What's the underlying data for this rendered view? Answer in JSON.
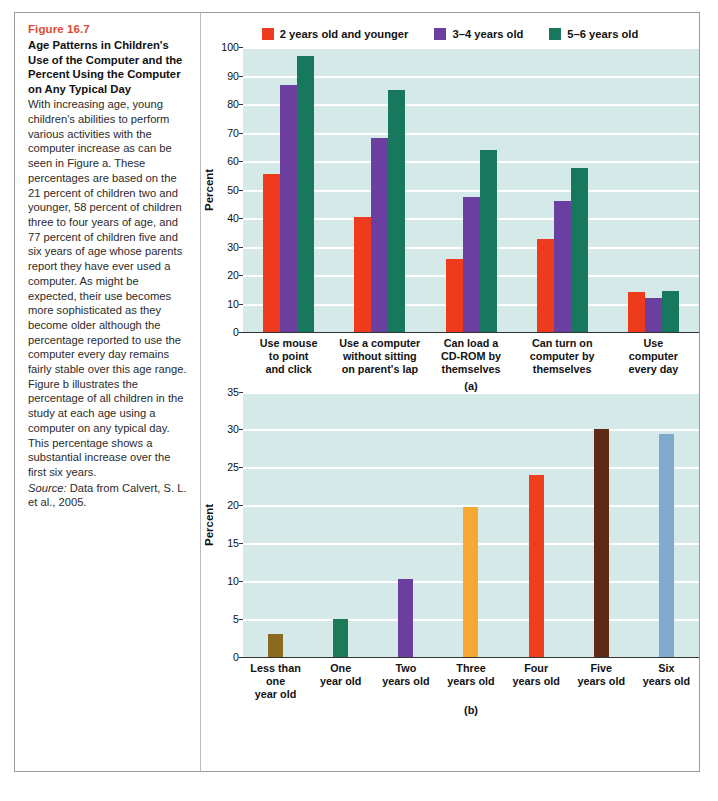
{
  "figure": {
    "number": "Figure 16.7",
    "title": "Age Patterns in Children's Use of the Computer and the Percent Using the Computer on Any Typical Day",
    "body": "With increasing age, young children's abilities to perform various activities with the computer increase as can be seen in Figure a. These percentages are based on the 21 percent of children two and younger, 58 percent of children three to four years of age, and 77 percent of children five and six years of age whose parents report they have ever used a computer. As might be expected, their use becomes more sophisticated as they become older although the percentage reported to use the computer every day remains fairly stable over this age range. Figure b illustrates the percentage of all children in the study at each age using a computer on any typical day. This percentage shows a substantial increase over the first six years.",
    "source_label": "Source:",
    "source_text": " Data from Calvert, S. L. et al., 2005."
  },
  "colors": {
    "accent": "#E04A2F",
    "plot_background": "#D6E9E9",
    "gridline": "#FFFFFF",
    "series_red": "#EE3B1E",
    "series_purple": "#6B3FA0",
    "series_green": "#17785E",
    "b_olive": "#8A6A1E",
    "b_green": "#1C7A58",
    "b_purple": "#6B3FA0",
    "b_orange": "#F7A833",
    "b_red": "#EF3E1C",
    "b_brown": "#5E2A17",
    "b_blue": "#7FAACD"
  },
  "chart_data": [
    {
      "id": "chart-a",
      "type": "bar",
      "title": "",
      "panel_caption": "(a)",
      "xlabel": "",
      "ylabel": "Percent",
      "ylim": [
        0,
        100
      ],
      "ytick_step": 10,
      "yticks": [
        0,
        10,
        20,
        30,
        40,
        50,
        60,
        70,
        80,
        90,
        100
      ],
      "grid": true,
      "legend_position": "top-center",
      "categories": [
        "Use mouse to point and click",
        "Use a computer without sitting on parent's lap",
        "Can load a CD-ROM by themselves",
        "Can turn on computer by themselves",
        "Use computer every day"
      ],
      "category_lines": [
        [
          "Use mouse",
          "to point",
          "and click"
        ],
        [
          "Use a computer",
          "without sitting",
          "on parent's lap"
        ],
        [
          "Can load a",
          "CD-ROM by",
          "themselves"
        ],
        [
          "Can turn on",
          "computer by",
          "themselves"
        ],
        [
          "Use",
          "computer",
          "every day"
        ]
      ],
      "series": [
        {
          "name": "2 years old and younger",
          "color": "#EE3B1E",
          "values": [
            55.5,
            40.5,
            25.5,
            32.5,
            14.0
          ]
        },
        {
          "name": "3–4 years old",
          "color": "#6B3FA0",
          "values": [
            86.5,
            68.0,
            47.5,
            46.0,
            12.0
          ]
        },
        {
          "name": "5–6 years old",
          "color": "#17785E",
          "values": [
            97.0,
            85.0,
            64.0,
            57.5,
            14.5
          ]
        }
      ]
    },
    {
      "id": "chart-b",
      "type": "bar",
      "title": "",
      "panel_caption": "(b)",
      "xlabel": "",
      "ylabel": "Percent",
      "ylim": [
        0,
        35
      ],
      "ytick_step": 5,
      "yticks": [
        0,
        5,
        10,
        15,
        20,
        25,
        30,
        35
      ],
      "grid": true,
      "legend_position": "none",
      "categories": [
        "Less than one year old",
        "One year old",
        "Two years old",
        "Three years old",
        "Four years old",
        "Five years old",
        "Six years old"
      ],
      "category_lines": [
        [
          "Less than one",
          "year old"
        ],
        [
          "One",
          "year old"
        ],
        [
          "Two",
          "years old"
        ],
        [
          "Three",
          "years old"
        ],
        [
          "Four",
          "years old"
        ],
        [
          "Five",
          "years old"
        ],
        [
          "Six",
          "years old"
        ]
      ],
      "values": [
        3.0,
        5.0,
        10.2,
        19.7,
        24.0,
        30.0,
        29.4
      ],
      "bar_colors": [
        "#8A6A1E",
        "#1C7A58",
        "#6B3FA0",
        "#F7A833",
        "#EF3E1C",
        "#5E2A17",
        "#7FAACD"
      ]
    }
  ],
  "legend": {
    "items": [
      {
        "label": "2 years old and younger",
        "color": "#EE3B1E"
      },
      {
        "label": "3–4 years old",
        "color": "#6B3FA0"
      },
      {
        "label": "5–6 years old",
        "color": "#17785E"
      }
    ]
  }
}
